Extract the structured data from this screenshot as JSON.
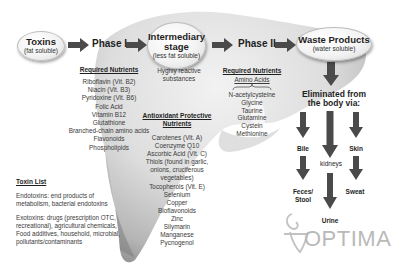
{
  "flow": {
    "toxins": {
      "title": "Toxins",
      "subtitle": "(fat soluble)"
    },
    "phase1": {
      "label": "Phase I"
    },
    "intermediary": {
      "title_line1": "Intermediary",
      "title_line2": "stage",
      "subtitle": "(less fat soluble)"
    },
    "phase2": {
      "label": "Phase II"
    },
    "waste": {
      "title": "Waste Products",
      "subtitle": "(water soluble)"
    }
  },
  "phase1_nutrients": {
    "heading": "Required Nutrients",
    "items": [
      "Riboflavin (Vit. B2)",
      "Niacin (Vit. B3)",
      "Pyridoxine (Vit. B6)",
      "Folic Acid",
      "Vitamin B12",
      "Glutathione",
      "Branched-chain amino acids",
      "Flavonoids",
      "Phospholipids"
    ]
  },
  "intermediary_notes": {
    "reactive_line1": "Hyghly reactive",
    "reactive_line2": "substances"
  },
  "antioxidants": {
    "heading_line1": "Antioxidant Protective",
    "heading_line2": "Nutrients",
    "items": [
      "Carotenes (Vit. A)",
      "Coenzyme Q10",
      "Ascorbic Acid (Vit. C)",
      "Thiols (found in garlic,",
      "onions, cruciferous",
      "vegetables)",
      "Tocopherols (Vit. E)",
      "Selenium",
      "Copper",
      "Bioflavonoids",
      "Zinc",
      "Silymarin",
      "Manganese",
      "Pycnogenol"
    ]
  },
  "phase2_nutrients": {
    "heading": "Required Nutrients",
    "subheading": "Amino Acids",
    "items": [
      "N-acetylcysteine",
      "Glycine",
      "Taurine",
      "Glutamine",
      "Cystein",
      "Methionine"
    ]
  },
  "elimination": {
    "heading_line1": "Eliminated from",
    "heading_line2": "the body via:",
    "routes": {
      "bile": "Bile",
      "kidneys": "kidneys",
      "skin": "Skin",
      "feces_line1": "Feces/",
      "feces_line2": "Stool",
      "urine": "Urine",
      "sweat": "Sweat"
    }
  },
  "toxin_list": {
    "heading": "Toxin List",
    "endotoxins_line1": "Endotoxins: end products of",
    "endotoxins_line2": "metabolism, bacterial endotoxins",
    "exotoxins_line1": "Exotoxins: drugs (prescription OTC,",
    "exotoxins_line2": "recreational), agricultural chemicals,",
    "exotoxins_line3": "Food additives, household, microbial,",
    "exotoxins_line4": "pollutants/contaminants"
  },
  "logo": {
    "text": "OPTIMA"
  },
  "colors": {
    "liver_light": "#e6e6e6",
    "liver_dark": "#8c8c8c",
    "arrow": "#4a4a4a",
    "logo": "#b9b9b9"
  }
}
